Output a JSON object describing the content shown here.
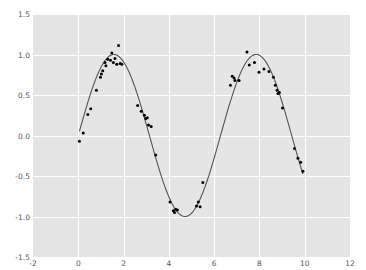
{
  "chart_data": {
    "type": "scatter",
    "title": "",
    "subtitle": "",
    "xlabel": "",
    "ylabel": "",
    "xlim": [
      -2,
      12
    ],
    "ylim": [
      -1.5,
      1.5
    ],
    "grid": true,
    "legend": null,
    "style": "ggplot",
    "background_color": "#e5e5e5",
    "gridline_color": "#ffffff",
    "figure_color": "#ffffff",
    "marker_color": "#000000",
    "line_color": "#555555",
    "xticks": [
      -2,
      0,
      2,
      4,
      6,
      8,
      10,
      12
    ],
    "xtick_labels": [
      "-2",
      "0",
      "2",
      "4",
      "6",
      "8",
      "10",
      "12"
    ],
    "yticks": [
      -1.5,
      -1.0,
      -0.5,
      0.0,
      0.5,
      1.0,
      1.5
    ],
    "ytick_labels": [
      "-1.5",
      "-1.0",
      "-0.5",
      "0.0",
      "0.5",
      "1.0",
      "1.5"
    ],
    "series": [
      {
        "name": "data points",
        "type": "scatter",
        "marker": "circle",
        "marker_size": 3,
        "color": "#000000",
        "points": [
          [
            0.05,
            -0.07
          ],
          [
            0.22,
            0.03
          ],
          [
            0.42,
            0.26
          ],
          [
            0.55,
            0.33
          ],
          [
            0.8,
            0.56
          ],
          [
            0.98,
            0.72
          ],
          [
            1.02,
            0.76
          ],
          [
            1.08,
            0.8
          ],
          [
            1.18,
            0.9
          ],
          [
            1.22,
            0.86
          ],
          [
            1.3,
            0.94
          ],
          [
            1.42,
            0.93
          ],
          [
            1.48,
            1.02
          ],
          [
            1.55,
            0.9
          ],
          [
            1.62,
            0.95
          ],
          [
            1.7,
            0.88
          ],
          [
            1.78,
            1.11
          ],
          [
            1.85,
            0.89
          ],
          [
            1.92,
            0.88
          ],
          [
            2.62,
            0.37
          ],
          [
            2.78,
            0.3
          ],
          [
            2.92,
            0.25
          ],
          [
            2.98,
            0.21
          ],
          [
            3.05,
            0.22
          ],
          [
            3.1,
            0.13
          ],
          [
            3.22,
            0.11
          ],
          [
            3.42,
            -0.24
          ],
          [
            4.05,
            -0.82
          ],
          [
            4.2,
            -0.93
          ],
          [
            4.25,
            -0.95
          ],
          [
            4.3,
            -0.91
          ],
          [
            4.38,
            -0.92
          ],
          [
            5.22,
            -0.87
          ],
          [
            5.3,
            -0.82
          ],
          [
            5.38,
            -0.88
          ],
          [
            5.5,
            -0.58
          ],
          [
            6.72,
            0.62
          ],
          [
            6.8,
            0.73
          ],
          [
            6.88,
            0.71
          ],
          [
            6.92,
            0.68
          ],
          [
            7.1,
            0.68
          ],
          [
            7.45,
            1.03
          ],
          [
            7.55,
            0.87
          ],
          [
            7.78,
            0.9
          ],
          [
            7.98,
            0.78
          ],
          [
            8.2,
            0.82
          ],
          [
            8.42,
            0.79
          ],
          [
            8.62,
            0.72
          ],
          [
            8.7,
            0.62
          ],
          [
            8.78,
            0.56
          ],
          [
            8.82,
            0.52
          ],
          [
            8.88,
            0.53
          ],
          [
            9.02,
            0.34
          ],
          [
            9.55,
            -0.16
          ],
          [
            9.7,
            -0.28
          ],
          [
            9.82,
            -0.33
          ],
          [
            9.92,
            -0.44
          ]
        ]
      },
      {
        "name": "fitted curve",
        "type": "line",
        "color": "#555555",
        "linewidth": 1,
        "expression": "sin(x)",
        "x_range": [
          0.05,
          9.92
        ]
      }
    ]
  },
  "axes": {
    "top": 14,
    "left": 33,
    "width": 317,
    "height": 243
  }
}
